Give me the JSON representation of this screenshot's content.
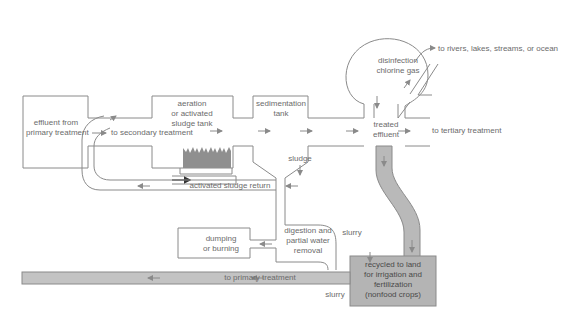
{
  "diagram": {
    "colors": {
      "line": "#8a8a8a",
      "text": "#6b6b6b",
      "sludge_pipe": "#b9b9b9",
      "recycle_box": "#b4b4b4",
      "aeration_bubbles": "#8f8f8f"
    },
    "nodes": {
      "primary_effluent": "effluent from\nprimary treatment",
      "aeration_tank": "aeration\nor activated\nsludge tank",
      "sedimentation_tank": "sedimentation\ntank",
      "disinfection": "disinfection\nchlorine gas",
      "treated_effluent": "treated\neffluent",
      "digestion": "digestion and\npartial water\nremoval",
      "dumping": "dumping\nor burning",
      "recycled_land": "recycled to land\nfor irrigation and\nfertilization\n(nonfood crops)"
    },
    "flow_labels": {
      "to_secondary": "to secondary treatment",
      "to_rivers": "to rivers, lakes, streams, or ocean",
      "to_tertiary": "to tertiary treatment",
      "sludge": "sludge",
      "activated_sludge_return": "activated sludge return",
      "slurry_top": "slurry",
      "slurry_bottom": "slurry",
      "to_primary": "to primary treatment"
    }
  }
}
